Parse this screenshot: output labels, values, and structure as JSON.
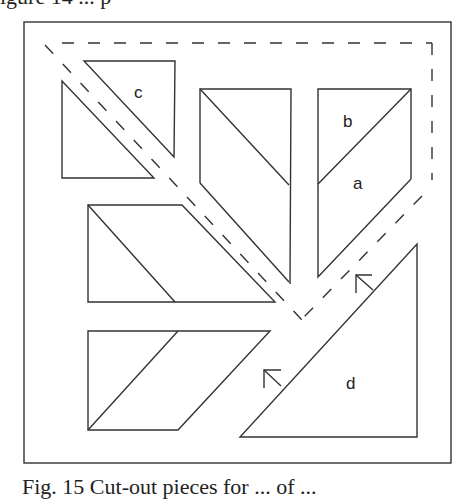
{
  "figure": {
    "top_text_clipped": "igure 14  ...  p",
    "caption": "Fig. 15  Cut-out pieces for ... of ...",
    "piece_labels": {
      "a": "a",
      "b": "b",
      "c": "c",
      "d": "d"
    },
    "stroke_color": "#333333",
    "background_color": "#ffffff"
  }
}
